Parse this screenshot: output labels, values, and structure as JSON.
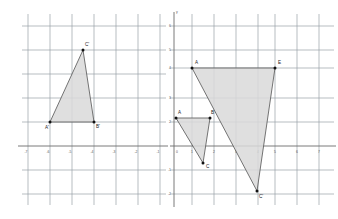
{
  "figure": {
    "background_color": "#ffffff",
    "grid_color": "#9aa0a6",
    "axis_color": "#6b6b6b",
    "shape_fill": "#d9d9d9",
    "shape_stroke": "#5c5c5c",
    "vertex_color": "#111111"
  },
  "left_plane": {
    "name": "left-coordinate-grid",
    "axis_names": {
      "x": "x",
      "y": "y"
    },
    "x_ticks": [
      "-7",
      "-6",
      "-5",
      "-4",
      "-3",
      "-2",
      "-1"
    ],
    "y_ticks": [
      "6",
      "5",
      "4",
      "3",
      "2",
      "1",
      "0",
      "-1",
      "-2",
      "-3"
    ],
    "triangle": {
      "name": "triangle-A-prime-B-prime-C-prime",
      "vertices": [
        {
          "label": "A'",
          "x": -6,
          "y": 2
        },
        {
          "label": "B'",
          "x": -4,
          "y": 2
        },
        {
          "label": "C'",
          "x": -4.5,
          "y": 5
        }
      ]
    }
  },
  "right_plane": {
    "name": "right-coordinate-grid",
    "axis_names": {
      "x": "x",
      "y": "y"
    },
    "x_ticks": [
      "0",
      "1",
      "2",
      "3",
      "4",
      "5",
      "6",
      "7"
    ],
    "y_ticks": [
      "6",
      "5",
      "4",
      "3",
      "2",
      "1",
      "0",
      "-1",
      "-2",
      "-3"
    ],
    "small_triangle": {
      "name": "triangle-A-B-C",
      "vertices": [
        {
          "label": "A",
          "x": 0.5,
          "y": 1.5
        },
        {
          "label": "B",
          "x": 1.5,
          "y": 1.5
        },
        {
          "label": "C",
          "x": 1.25,
          "y": -0.75
        }
      ]
    },
    "large_triangle": {
      "name": "triangle-A-E-C-prime",
      "vertices": [
        {
          "label": "A",
          "x": 1,
          "y": 4
        },
        {
          "label": "E",
          "x": 5,
          "y": 4
        },
        {
          "label": "C'",
          "x": 4,
          "y": -2
        }
      ]
    }
  },
  "labels": {
    "left_vertex_a": "A'",
    "left_vertex_b": "B'",
    "left_vertex_c": "C'",
    "right_small_a": "A",
    "right_small_b": "B",
    "right_small_c": "C",
    "right_large_a": "A",
    "right_large_e": "E",
    "right_large_c": "C'",
    "axis_x": "x",
    "axis_y": "y"
  }
}
